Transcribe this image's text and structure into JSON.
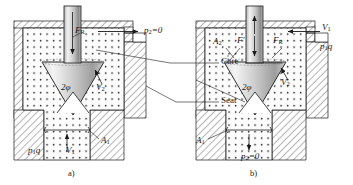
{
  "figure": {
    "background": "#ffffff",
    "line_color": "#1a1a1a",
    "fluid_fill": "#f2f2f2",
    "cone_light": "#e8e8e8",
    "cone_dark": "#9a9a9a",
    "stem_light": "#ededed",
    "stem_dark": "#8f8f8f"
  },
  "panels": [
    {
      "id": "a",
      "caption": "a)",
      "labels": [
        {
          "key": "FR",
          "text": "F",
          "sub": "R",
          "x": 75,
          "y": 30
        },
        {
          "key": "p2",
          "text": "p",
          "sub": "2",
          "suffix": "=0",
          "x": 144,
          "y": 31
        },
        {
          "key": "phi",
          "text": "2φ",
          "sub": "",
          "x": 61,
          "y": 88
        },
        {
          "key": "V2",
          "text": "V",
          "sub": "2",
          "x": 96,
          "y": 88
        },
        {
          "key": "p1q",
          "text": "p",
          "sub": "1",
          "suffix": "q",
          "x": 30,
          "y": 147
        },
        {
          "key": "V1",
          "text": "V",
          "sub": "1",
          "x": 68,
          "y": 147
        },
        {
          "key": "A1",
          "text": "A",
          "sub": "1",
          "x": 101,
          "y": 141
        }
      ]
    },
    {
      "id": "b",
      "caption": "b)",
      "labels": [
        {
          "key": "A2",
          "text": "A",
          "sub": "2",
          "x": 215,
          "y": 42
        },
        {
          "key": "Fp",
          "text": "F′",
          "sub": "",
          "x": 238,
          "y": 41
        },
        {
          "key": "FR",
          "text": "F",
          "sub": "R",
          "x": 274,
          "y": 41
        },
        {
          "key": "V1",
          "text": "V",
          "sub": "1",
          "x": 323,
          "y": 28
        },
        {
          "key": "p1q",
          "text": "p",
          "sub": "1",
          "suffix": "q",
          "x": 321,
          "y": 46
        },
        {
          "key": "phi",
          "text": "2φ",
          "sub": "",
          "x": 243,
          "y": 88
        },
        {
          "key": "V2",
          "text": "V",
          "sub": "2",
          "x": 282,
          "y": 83
        },
        {
          "key": "A1",
          "text": "A",
          "sub": "1",
          "x": 198,
          "y": 141
        },
        {
          "key": "p2",
          "text": "p",
          "sub": "2",
          "suffix": "=0",
          "x": 243,
          "y": 154
        }
      ]
    }
  ],
  "callouts": [
    {
      "key": "core",
      "text": "Core",
      "x": 222,
      "y": 61
    },
    {
      "key": "seat",
      "text": "Seat",
      "x": 222,
      "y": 101
    }
  ]
}
